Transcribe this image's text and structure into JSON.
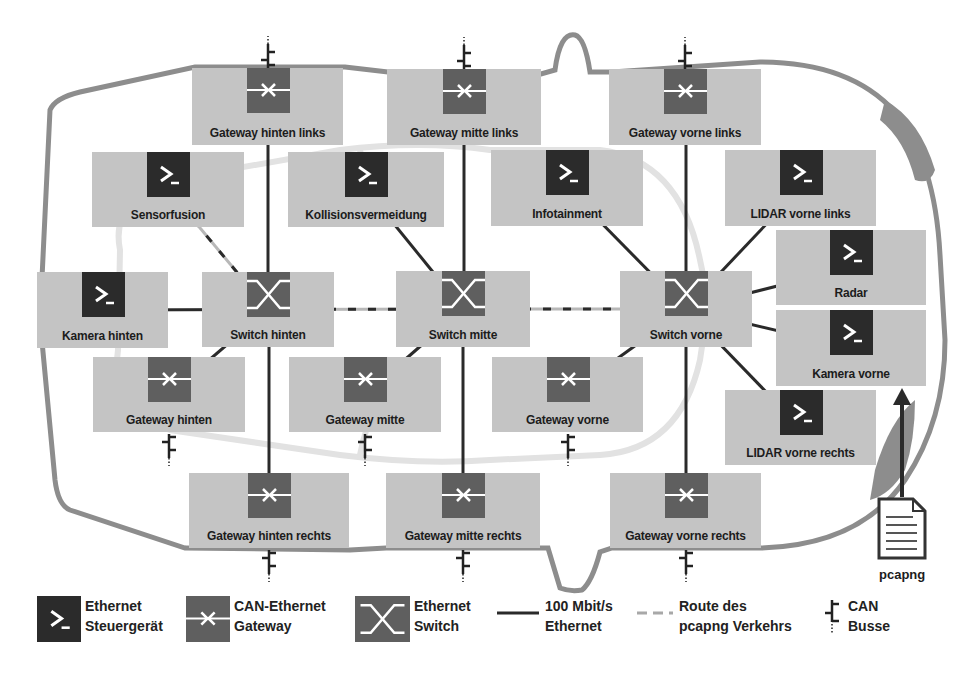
{
  "diagram": {
    "colors": {
      "box_fill": "#c4c4c4",
      "ecu_icon": "#2b2b2b",
      "gateway_icon": "#5f5f5f",
      "switch_icon": "#5f5f5f",
      "ethernet_line": "#2a2a2a",
      "route_line": "#b8b8b8",
      "car_outline": "#8a8a8a",
      "car_inner": "#e0e0e0"
    },
    "nodes": [
      {
        "id": "gw_hl",
        "type": "gateway",
        "label": "Gateway hinten links",
        "x": 192,
        "y": 68,
        "w": 151,
        "h": 77,
        "can_top": true
      },
      {
        "id": "gw_ml",
        "type": "gateway",
        "label": "Gateway mitte links",
        "x": 387,
        "y": 69,
        "w": 154,
        "h": 76,
        "can_top": true
      },
      {
        "id": "gw_vl",
        "type": "gateway",
        "label": "Gateway vorne links",
        "x": 609,
        "y": 69,
        "w": 152,
        "h": 76,
        "can_top": true
      },
      {
        "id": "sensorfusion",
        "type": "ecu",
        "label": "Sensorfusion",
        "x": 92,
        "y": 152,
        "w": 152,
        "h": 75
      },
      {
        "id": "kollision",
        "type": "ecu",
        "label": "Kollisionsvermeidung",
        "x": 288,
        "y": 152,
        "w": 156,
        "h": 75
      },
      {
        "id": "infotainment",
        "type": "ecu",
        "label": "Infotainment",
        "x": 491,
        "y": 150,
        "w": 152,
        "h": 76
      },
      {
        "id": "lidar_vl",
        "type": "ecu",
        "label": "LIDAR vorne links",
        "x": 725,
        "y": 150,
        "w": 151,
        "h": 76
      },
      {
        "id": "radar",
        "type": "ecu",
        "label": "Radar",
        "x": 776,
        "y": 230,
        "w": 150,
        "h": 75
      },
      {
        "id": "kamera_h",
        "type": "ecu",
        "label": "Kamera hinten",
        "x": 37,
        "y": 272,
        "w": 131,
        "h": 76
      },
      {
        "id": "switch_h",
        "type": "switch",
        "label": "Switch hinten",
        "x": 202,
        "y": 272,
        "w": 132,
        "h": 75
      },
      {
        "id": "switch_m",
        "type": "switch",
        "label": "Switch mitte",
        "x": 396,
        "y": 271,
        "w": 134,
        "h": 76
      },
      {
        "id": "switch_v",
        "type": "switch",
        "label": "Switch vorne",
        "x": 620,
        "y": 271,
        "w": 132,
        "h": 76
      },
      {
        "id": "kamera_v",
        "type": "ecu",
        "label": "Kamera vorne",
        "x": 776,
        "y": 310,
        "w": 150,
        "h": 76
      },
      {
        "id": "gw_h",
        "type": "gateway",
        "label": "Gateway hinten",
        "x": 93,
        "y": 357,
        "w": 152,
        "h": 75,
        "can_bottom": true
      },
      {
        "id": "gw_m",
        "type": "gateway",
        "label": "Gateway mitte",
        "x": 289,
        "y": 357,
        "w": 152,
        "h": 75,
        "can_bottom": true
      },
      {
        "id": "gw_v",
        "type": "gateway",
        "label": "Gateway vorne",
        "x": 492,
        "y": 357,
        "w": 151,
        "h": 75,
        "can_bottom": true
      },
      {
        "id": "lidar_vr",
        "type": "ecu",
        "label": "LIDAR vorne rechts",
        "x": 725,
        "y": 390,
        "w": 151,
        "h": 75
      },
      {
        "id": "gw_hr",
        "type": "gateway",
        "label": "Gateway hinten rechts",
        "x": 189,
        "y": 473,
        "w": 160,
        "h": 75,
        "can_bottom": true
      },
      {
        "id": "gw_mr",
        "type": "gateway",
        "label": "Gateway mitte rechts",
        "x": 386,
        "y": 473,
        "w": 154,
        "h": 75,
        "can_bottom": true
      },
      {
        "id": "gw_vr",
        "type": "gateway",
        "label": "Gateway vorne rechts",
        "x": 610,
        "y": 473,
        "w": 151,
        "h": 75,
        "can_bottom": true
      }
    ],
    "links": [
      {
        "from": "gw_hl",
        "to": "switch_h",
        "style": "ethernet"
      },
      {
        "from": "gw_ml",
        "to": "switch_m",
        "style": "ethernet"
      },
      {
        "from": "gw_vl",
        "to": "switch_v",
        "style": "ethernet"
      },
      {
        "from": "sensorfusion",
        "to": "switch_h",
        "style": "route"
      },
      {
        "from": "kollision",
        "to": "switch_m",
        "style": "ethernet"
      },
      {
        "from": "infotainment",
        "to": "switch_v",
        "style": "ethernet"
      },
      {
        "from": "lidar_vl",
        "to": "switch_v",
        "style": "ethernet"
      },
      {
        "from": "radar",
        "to": "switch_v",
        "style": "ethernet"
      },
      {
        "from": "kamera_v",
        "to": "switch_v",
        "style": "ethernet"
      },
      {
        "from": "lidar_vr",
        "to": "switch_v",
        "style": "ethernet"
      },
      {
        "from": "kamera_h",
        "to": "switch_h",
        "style": "ethernet"
      },
      {
        "from": "switch_h",
        "to": "switch_m",
        "style": "route"
      },
      {
        "from": "switch_m",
        "to": "switch_v",
        "style": "route"
      },
      {
        "from": "switch_h",
        "to": "gw_h",
        "style": "ethernet"
      },
      {
        "from": "switch_m",
        "to": "gw_m",
        "style": "ethernet"
      },
      {
        "from": "switch_v",
        "to": "gw_v",
        "style": "ethernet"
      },
      {
        "from": "switch_h",
        "to": "gw_hr",
        "style": "ethernet"
      },
      {
        "from": "switch_m",
        "to": "gw_mr",
        "style": "ethernet"
      },
      {
        "from": "switch_v",
        "to": "gw_vr",
        "style": "ethernet"
      }
    ],
    "pcapng": {
      "label": "pcapng",
      "file_icon": "document-icon",
      "arrow_target": "kamera_v"
    }
  },
  "legend": [
    {
      "key": "ecu",
      "icon": "terminal-icon",
      "text": "Ethernet\nSteuergerät"
    },
    {
      "key": "gateway",
      "icon": "gateway-icon",
      "text": "CAN-Ethernet\nGateway"
    },
    {
      "key": "switch",
      "icon": "switch-icon",
      "text": "Ethernet\nSwitch"
    },
    {
      "key": "ethernet",
      "icon": "solid-line-icon",
      "text": "100 Mbit/s\nEthernet"
    },
    {
      "key": "route",
      "icon": "dashed-line-icon",
      "text": "Route des\npcapng Verkehrs"
    },
    {
      "key": "can",
      "icon": "can-bus-icon",
      "text": "CAN\nBusse"
    }
  ]
}
